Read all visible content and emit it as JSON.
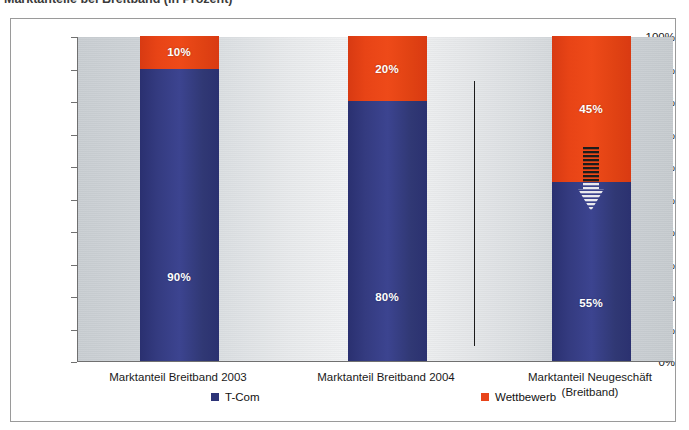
{
  "caption": {
    "text": "Marktanteile bei Breitband (in Prozent)",
    "clipped": true
  },
  "chart_data": {
    "type": "bar",
    "subtype": "stacked-100-percent",
    "title": "Marktanteile bei Breitband (in Prozent)",
    "xlabel": "",
    "ylabel": "",
    "ylim": [
      0,
      100
    ],
    "yunit": "%",
    "grid": false,
    "legend_position": "bottom",
    "categories": [
      "Marktanteil Breitband 2003",
      "Marktanteil Breitband 2004",
      "Marktanteil Neugeschäft (Breitband)"
    ],
    "category_lines": [
      [
        "Marktanteil Breitband 2003"
      ],
      [
        "Marktanteil Breitband 2004"
      ],
      [
        "Marktanteil Neugeschäft",
        "(Breitband)"
      ]
    ],
    "series": [
      {
        "name": "T-Com",
        "color": "#2d3478",
        "values": [
          90,
          80,
          55
        ],
        "labels": [
          "90%",
          "80%",
          "55%"
        ]
      },
      {
        "name": "Wettbewerb",
        "color": "#e8441a",
        "values": [
          10,
          20,
          45
        ],
        "labels": [
          "10%",
          "20%",
          "45%"
        ]
      }
    ],
    "ytick_values": [
      0,
      10,
      20,
      30,
      40,
      50,
      60,
      70,
      80,
      90,
      100
    ],
    "ytick_labels": [
      "0%",
      "10%",
      "20%",
      "30%",
      "40%",
      "50%",
      "60%",
      "70%",
      "80%",
      "90%",
      "100%"
    ],
    "annotations": [
      {
        "type": "striped-down-arrow",
        "name": "trend-down-arrow",
        "category_index": 2,
        "at_value": 55,
        "description": "Horizontally striped downward-pointing arrow straddling the T-Com/Wettbewerb boundary of the third bar"
      },
      {
        "type": "vertical-separator-line",
        "name": "group-separator",
        "between_categories": [
          1,
          2
        ],
        "color": "#1b1b1b"
      }
    ]
  },
  "legend": {
    "entries": [
      {
        "label": "T-Com",
        "color": "#2d3478"
      },
      {
        "label": "Wettbewerb",
        "color": "#e8441a"
      }
    ]
  },
  "colors": {
    "tcom_blue": "#2d3478",
    "wettbewerb_orange": "#e8441a",
    "plot_background": "#d5dade",
    "frame_border": "#9a9a9a",
    "axis": "#707070"
  }
}
